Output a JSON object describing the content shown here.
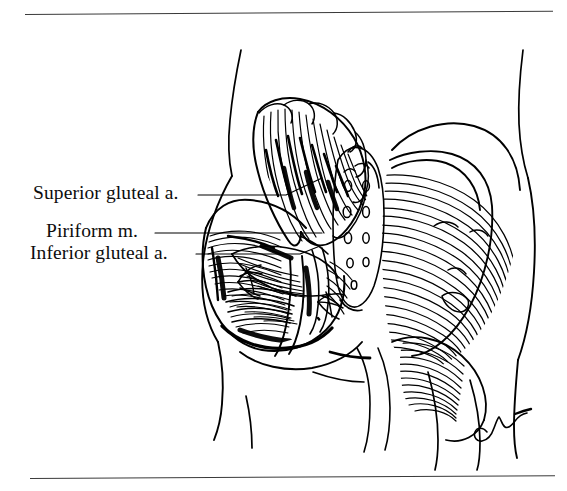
{
  "page": {
    "kind": "anatomical-line-illustration",
    "background_color": "#ffffff",
    "ink_color": "#000000",
    "width": 567,
    "height": 491
  },
  "rules": {
    "top_rule_label": "horizontal rule",
    "bottom_rule_label": "horizontal rule",
    "color": "#3a3a3a"
  },
  "labels": [
    {
      "id": "superior-gluteal-artery",
      "text": "Superior gluteal a.",
      "leader_from_x": 198,
      "leader_to_x": 320,
      "leader_y": 195
    },
    {
      "id": "piriform-muscle",
      "text": "Piriform m.",
      "leader_from_x": 155,
      "leader_to_x": 322,
      "leader_y": 233
    },
    {
      "id": "inferior-gluteal-artery",
      "text": "Inferior gluteal a.",
      "leader_from_x": 196,
      "leader_to_x": 318,
      "leader_y": 254
    }
  ],
  "illustration": {
    "title": "Gluteal region dissection, posterior view",
    "regions": [
      "reflected gluteus maximus",
      "intact gluteus maximus",
      "sacrum with posterior sacral foramina",
      "deep gluteal vessels and nerves",
      "torso and thigh contours"
    ]
  },
  "signature": {
    "name": "artist-signature",
    "text": ""
  }
}
